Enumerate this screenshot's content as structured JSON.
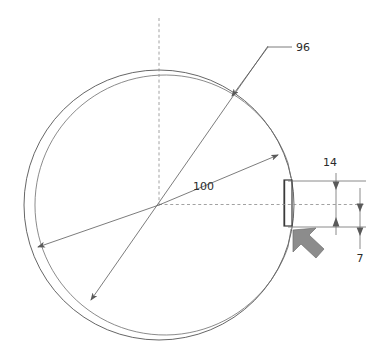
{
  "drawing": {
    "type": "engineering-section-view",
    "title_visible": false,
    "background_color": "#ffffff",
    "line_color": "#555555",
    "text_color": "#2b2b2b",
    "pointer_arrow_color": "#8c8c8c"
  },
  "labels": {
    "reference_96": "96",
    "radius_100": "100",
    "dimension_14": "14",
    "dimension_7": "7"
  },
  "geometry": {
    "center": {
      "x": 159,
      "y": 205
    },
    "outer_circle_radius": 135,
    "inner_arc_radius": 130,
    "slot": {
      "x": 284,
      "y": 180,
      "width": 8,
      "height": 46
    },
    "vertical_centerline": {
      "x": 159,
      "y_top": 18,
      "y_bottom": 205
    },
    "horizontal_centerline": {
      "y": 205,
      "x_left": 159,
      "x_right": 366
    },
    "dimension_14_line_x": 336,
    "dimension_7_line_x": 360,
    "dimension_14_extent": {
      "y_top": 181,
      "y_bottom": 227
    },
    "dimension_7_extent": {
      "y_top": 196,
      "y_bottom": 245
    }
  },
  "annotations": {
    "leader_96": {
      "label": "96",
      "elbow_x": 268,
      "elbow_y": 47,
      "text_x": 296,
      "text_y": 51,
      "arrow_tip_x": 232,
      "arrow_tip_y": 96
    },
    "radius_100": {
      "label": "100",
      "text_x": 193,
      "text_y": 190
    },
    "pointer": {
      "name": "view-direction-arrow",
      "x": 293,
      "y": 228,
      "direction": "up-left"
    }
  }
}
